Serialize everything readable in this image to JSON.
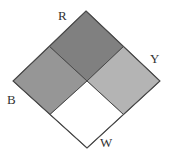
{
  "figure": {
    "name": "four-quadrant-diamond",
    "background_color": "#ffffff",
    "outline_color": "#4a4a4a",
    "outline_width": 1,
    "geometry": {
      "top_vertex": [
        86,
        11
      ],
      "right_vertex": [
        160,
        81
      ],
      "bottom_vertex": [
        87,
        148
      ],
      "left_vertex": [
        13,
        81
      ],
      "center": [
        87,
        81
      ]
    },
    "quadrants": [
      {
        "id": "top",
        "label": "R",
        "fill": "#808080",
        "label_position": [
          58,
          9
        ],
        "points": "86,11 160,81 87,148 13,81"
      }
    ],
    "labels": [
      {
        "id": "label-R",
        "text": "R",
        "position": "top",
        "color": "#333333"
      },
      {
        "id": "label-Y",
        "text": "Y",
        "position": "right",
        "color": "#333333"
      },
      {
        "id": "label-B",
        "text": "B",
        "position": "left",
        "color": "#333333"
      },
      {
        "id": "label-W",
        "text": "W",
        "position": "bottom",
        "color": "#333333"
      }
    ],
    "colors": {
      "red_square": "#808080",
      "blue_square": "#969696",
      "yellow_square": "#b4b4b4",
      "white_square": "#ffffff",
      "stroke": "#4a4a4a",
      "label_text": "#333333"
    }
  }
}
